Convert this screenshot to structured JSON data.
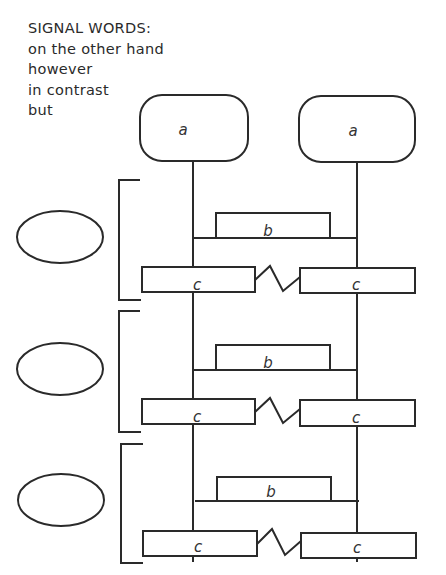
{
  "signal_words": {
    "title": "SIGNAL WORDS:",
    "items": [
      "on the other hand",
      "however",
      "in contrast",
      "but"
    ]
  },
  "top_boxes": [
    {
      "label": "a"
    },
    {
      "label": "a"
    }
  ],
  "sections": [
    {
      "b_label": "b",
      "c_left": "c",
      "c_right": "c"
    },
    {
      "b_label": "b",
      "c_left": "c",
      "c_right": "c"
    },
    {
      "b_label": "b",
      "c_left": "c",
      "c_right": "c"
    }
  ]
}
